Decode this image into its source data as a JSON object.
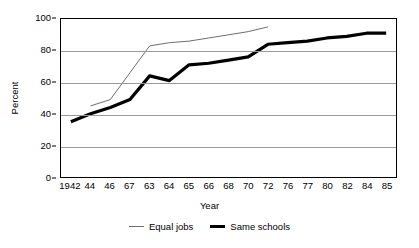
{
  "chart_data": {
    "type": "line",
    "title": "",
    "subtitle": "",
    "xlabel": "Year",
    "ylabel": "Percent",
    "ylim": [
      0,
      100
    ],
    "yticks": [
      0,
      20,
      40,
      60,
      80,
      100
    ],
    "grid": "horizontal",
    "legend_position": "bottom",
    "categories": [
      "1942",
      "44",
      "46",
      "67",
      "63",
      "64",
      "65",
      "66",
      "68",
      "70",
      "72",
      "76",
      "77",
      "80",
      "82",
      "84",
      "85"
    ],
    "series": [
      {
        "name": "Equal jobs",
        "style": "thin-line",
        "color": "#6e6e6e",
        "values": [
          null,
          45,
          49,
          66,
          83,
          85,
          86,
          88,
          90,
          92,
          95,
          null,
          null,
          null,
          null,
          null,
          null
        ]
      },
      {
        "name": "Same schools",
        "style": "thick-line",
        "color": "#000000",
        "values": [
          35,
          40,
          44,
          49,
          64,
          61,
          71,
          72,
          74,
          76,
          84,
          85,
          86,
          88,
          89,
          91,
          91
        ]
      }
    ]
  },
  "axes": {
    "y_tick_labels": [
      "100",
      "80",
      "60",
      "40",
      "20",
      "0"
    ],
    "y_title": "Percent",
    "x_title": "Year"
  },
  "legend": {
    "entries": [
      {
        "label": "Equal jobs"
      },
      {
        "label": "Same schools"
      }
    ]
  }
}
